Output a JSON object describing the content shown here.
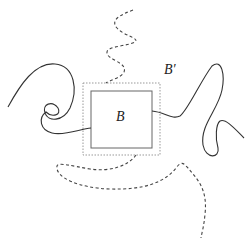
{
  "labels": {
    "inner_box": "B",
    "outer_box": "B′"
  },
  "colors": {
    "curve": "#333333",
    "inner_box": "#666666",
    "outer_box": "#999999"
  }
}
